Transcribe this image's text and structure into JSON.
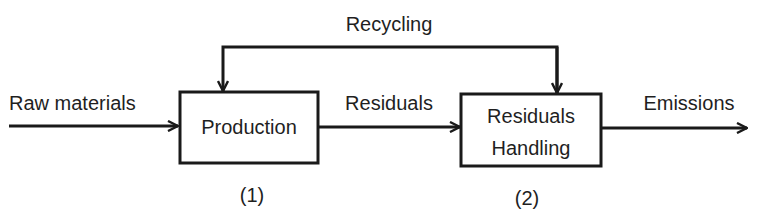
{
  "diagram": {
    "type": "flow",
    "nodes": [
      {
        "id": "production",
        "label": "Production",
        "number": "(1)"
      },
      {
        "id": "residuals_handling",
        "label_line1": "Residuals",
        "label_line2": "Handling",
        "number": "(2)"
      }
    ],
    "edges": [
      {
        "from": "input",
        "to": "production",
        "label": "Raw materials"
      },
      {
        "from": "production",
        "to": "residuals_handling",
        "label": "Residuals"
      },
      {
        "from": "residuals_handling",
        "to": "output",
        "label": "Emissions"
      },
      {
        "from": "residuals_handling",
        "to": "production",
        "label": "Recycling"
      }
    ],
    "colors": {
      "stroke": "#1a1a1a",
      "text": "#1f1f1f",
      "background": "#ffffff"
    }
  }
}
